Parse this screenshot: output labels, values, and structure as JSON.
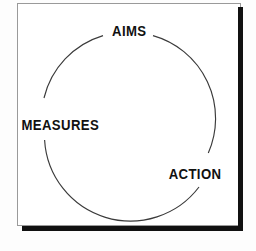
{
  "diagram": {
    "type": "cycle",
    "title": "",
    "shape": "circle",
    "frame": {
      "border_color": "#9a9a9a",
      "shadow_color": "#111111",
      "background_color": "#ffffff"
    },
    "circle": {
      "stroke_color": "#3a3a3a",
      "center_x": 111,
      "center_y": 116,
      "radius": 86,
      "gaps_at_labels": true
    },
    "nodes": [
      {
        "id": "aims",
        "label": "AIMS",
        "position": "top",
        "angle_degrees": 90,
        "color": "#111111"
      },
      {
        "id": "measures",
        "label": "MEASURES",
        "position": "left",
        "angle_degrees": 180,
        "color": "#111111"
      },
      {
        "id": "action",
        "label": "ACTION",
        "position": "bottom-right",
        "angle_degrees": 325,
        "color": "#111111"
      }
    ],
    "flow_order": [
      "AIMS",
      "ACTION",
      "MEASURES"
    ]
  }
}
